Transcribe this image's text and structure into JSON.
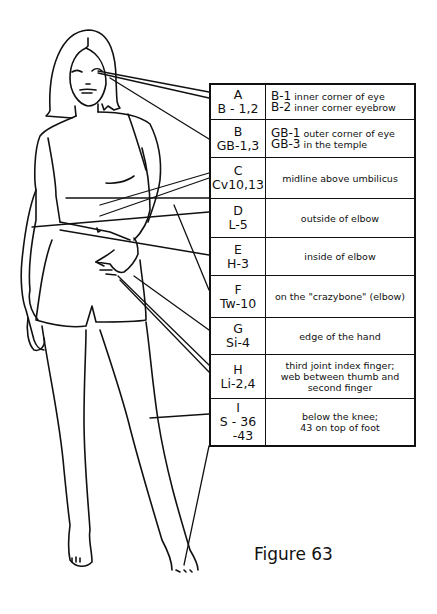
{
  "caption": "Figure 63",
  "table": {
    "rows": [
      {
        "letter": "A",
        "code": "B - 1,2",
        "code2": "",
        "lines": [
          {
            "pt": "B-1",
            "text": "inner corner of eye"
          },
          {
            "pt": "B-2",
            "text": "inner corner eyebrow"
          }
        ]
      },
      {
        "letter": "B",
        "code": "GB-1,3",
        "code2": "",
        "lines": [
          {
            "pt": "GB-1",
            "text": "outer corner of eye"
          },
          {
            "pt": "GB-3",
            "text": "in the temple"
          }
        ]
      },
      {
        "letter": "C",
        "code": "Cv10,13",
        "code2": "",
        "desc": "midline above umbilicus"
      },
      {
        "letter": "D",
        "code": "L-5",
        "code2": "",
        "desc": "outside of elbow"
      },
      {
        "letter": "E",
        "code": "H-3",
        "code2": "",
        "desc": "inside of elbow"
      },
      {
        "letter": "F",
        "code": "Tw-10",
        "code2": "",
        "desc": "on the \"crazybone\" (elbow)"
      },
      {
        "letter": "G",
        "code": "Si-4",
        "code2": "",
        "desc": "edge of the hand"
      },
      {
        "letter": "H",
        "code": "Li-2,4",
        "code2": "",
        "desc1": "third joint index finger;",
        "desc2": "web between thumb and",
        "desc3": "second finger"
      },
      {
        "letter": "I",
        "code": "S - 36",
        "code2": "-43",
        "desc1": "below the knee;",
        "desc2": "43 on top of foot"
      }
    ]
  },
  "colors": {
    "ink": "#111111",
    "paper": "#ffffff"
  }
}
